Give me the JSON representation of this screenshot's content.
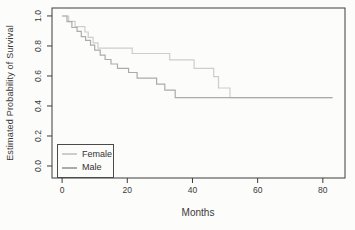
{
  "chart_data": {
    "type": "line",
    "subtype": "kaplan-meier-step",
    "title": "",
    "xlabel": "Months",
    "ylabel": "Estimated Probability of Survival",
    "x_ticks": [
      0,
      20,
      40,
      60,
      80
    ],
    "y_ticks": [
      "0.0",
      "0.2",
      "0.4",
      "0.6",
      "0.8",
      "1.0"
    ],
    "xlim": [
      -3.1,
      86.8
    ],
    "ylim": [
      -0.08,
      1.053
    ],
    "x_end": 83,
    "grid": false,
    "legend": {
      "position": "bottom-left",
      "border": true,
      "entries": [
        "Female",
        "Male"
      ]
    },
    "series": [
      {
        "name": "Female",
        "color": "#cdcdcd",
        "steps": [
          [
            0,
            1.0
          ],
          [
            2,
            0.964
          ],
          [
            4,
            0.929
          ],
          [
            7,
            0.893
          ],
          [
            8,
            0.857
          ],
          [
            9.5,
            0.821
          ],
          [
            11,
            0.786
          ],
          [
            21.5,
            0.75
          ],
          [
            33,
            0.707
          ],
          [
            40.5,
            0.651
          ],
          [
            46.5,
            0.595
          ],
          [
            48,
            0.52
          ],
          [
            51.5,
            0.455
          ]
        ]
      },
      {
        "name": "Male",
        "color": "#ababab",
        "steps": [
          [
            0,
            1.0
          ],
          [
            1.5,
            0.962
          ],
          [
            3,
            0.923
          ],
          [
            4.6,
            0.897
          ],
          [
            5.9,
            0.862
          ],
          [
            7.2,
            0.838
          ],
          [
            8.7,
            0.805
          ],
          [
            10,
            0.772
          ],
          [
            11.7,
            0.739
          ],
          [
            13.2,
            0.71
          ],
          [
            15,
            0.68
          ],
          [
            17,
            0.651
          ],
          [
            20.4,
            0.623
          ],
          [
            23,
            0.585
          ],
          [
            29,
            0.546
          ],
          [
            31.5,
            0.506
          ],
          [
            34.7,
            0.455
          ]
        ]
      }
    ]
  },
  "colors": {
    "axis": "#3d3d3d",
    "text": "#3a3a3a",
    "background": "#fcfcfa"
  }
}
